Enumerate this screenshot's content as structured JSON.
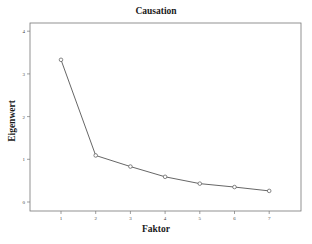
{
  "chart_data": {
    "type": "line",
    "title": "Causation",
    "xlabel": "Faktor",
    "ylabel": "Eigenwert",
    "x": [
      1,
      2,
      3,
      4,
      5,
      6,
      7
    ],
    "categories": [
      "1",
      "2",
      "3",
      "4",
      "5",
      "6",
      "7"
    ],
    "series": [
      {
        "name": "Eigenwert",
        "values": [
          3.33,
          1.09,
          0.83,
          0.59,
          0.43,
          0.35,
          0.26
        ]
      }
    ],
    "yticks": [
      "0",
      "1",
      "2",
      "3",
      "4"
    ],
    "ylim": [
      -0.2,
      4.2
    ],
    "grid": false,
    "legend": "none",
    "marker": "circle-open",
    "line_color": "#555555"
  }
}
